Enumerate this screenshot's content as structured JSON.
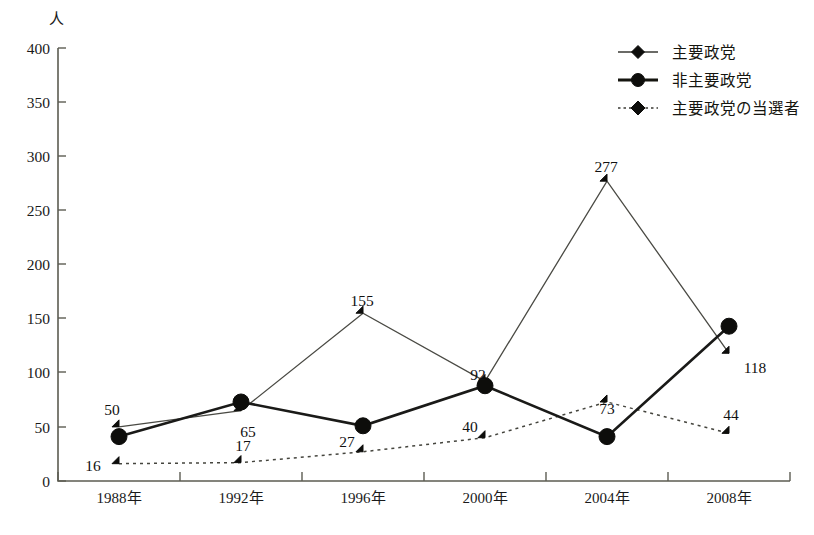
{
  "chart_data": {
    "type": "line",
    "title": "",
    "xlabel": "",
    "ylabel": "人",
    "ylim": [
      0,
      400
    ],
    "yticks": [
      0,
      50,
      100,
      150,
      200,
      250,
      300,
      350,
      400
    ],
    "ytick_labels": [
      "0",
      "50",
      "100",
      "150",
      "200",
      "250",
      "300",
      "350",
      "400"
    ],
    "grid": false,
    "legend_position": "top-right",
    "categories": [
      "1988年",
      "1992年",
      "1996年",
      "2000年",
      "2004年",
      "2008年"
    ],
    "series": [
      {
        "name": "主要政党",
        "marker": "diamond",
        "line_style": "solid-thin",
        "values": [
          50,
          65,
          155,
          92,
          277,
          118
        ],
        "data_labels": [
          "50",
          "65",
          "155",
          "92",
          "277",
          "118"
        ]
      },
      {
        "name": "非主要政党",
        "marker": "circle",
        "line_style": "solid-thick",
        "values": [
          41,
          73,
          51,
          88,
          41,
          143
        ],
        "data_labels": [
          "",
          "",
          "",
          "",
          "",
          ""
        ]
      },
      {
        "name": "主要政党の当選者",
        "marker": "diamond",
        "line_style": "dotted",
        "values": [
          16,
          17,
          27,
          40,
          73,
          44
        ],
        "data_labels": [
          "16",
          "17",
          "27",
          "40",
          "73",
          "44"
        ]
      }
    ]
  },
  "axis": {
    "unit_label": "人",
    "y_tick_labels": [
      "400",
      "350",
      "300",
      "250",
      "200",
      "150",
      "100",
      "50",
      "0"
    ],
    "x_tick_labels": [
      "1988年",
      "1992年",
      "1996年",
      "2000年",
      "2004年",
      "2008年"
    ]
  },
  "legend": {
    "items": [
      {
        "label": "主要政党",
        "style": "solid-thin",
        "marker": "diamond"
      },
      {
        "label": "非主要政党",
        "style": "solid-thick",
        "marker": "circle"
      },
      {
        "label": "主要政党の当選者",
        "style": "dotted",
        "marker": "diamond"
      }
    ]
  },
  "value_labels": {
    "main_party": [
      "50",
      "65",
      "155",
      "92",
      "277",
      "118"
    ],
    "elected": [
      "16",
      "17",
      "27",
      "40",
      "73",
      "44"
    ]
  },
  "caption": {
    "text": ""
  }
}
